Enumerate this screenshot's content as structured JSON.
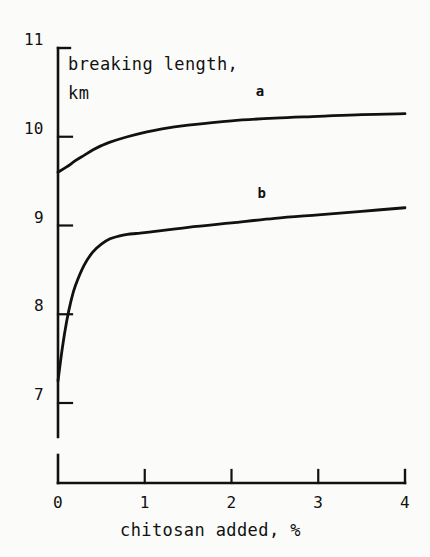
{
  "figure": {
    "background_color": "#fbfbfa",
    "ink_color": "#111111"
  },
  "chart_data": {
    "type": "line",
    "title": "",
    "xlabel": "chitosan added, %",
    "ylabel": "breaking length, km",
    "ylabel_line1": "breaking length,",
    "ylabel_line2": "km",
    "xlim": [
      0,
      4
    ],
    "ylim": [
      7,
      11
    ],
    "xticks": [
      0,
      1,
      2,
      3,
      4
    ],
    "yticks": [
      7,
      8,
      9,
      10,
      11
    ],
    "xtick_labels": [
      "0",
      "1",
      "2",
      "3",
      "4"
    ],
    "ytick_labels": [
      "7",
      "8",
      "9",
      "10",
      "11"
    ],
    "grid": false,
    "legend": "inline-curve-labels",
    "y_axis_break": true,
    "y_axis_break_note": "axis line is broken below the 7 tick before meeting the x-axis origin",
    "series": [
      {
        "name": "a",
        "label": "a",
        "label_x": 2.28,
        "label_y": 10.5,
        "x": [
          0,
          0.1,
          0.2,
          0.3,
          0.4,
          0.5,
          0.6,
          0.8,
          1.0,
          1.2,
          1.5,
          2.0,
          2.5,
          3.0,
          3.5,
          4.0
        ],
        "y": [
          9.6,
          9.66,
          9.73,
          9.79,
          9.85,
          9.9,
          9.94,
          10.0,
          10.05,
          10.09,
          10.13,
          10.18,
          10.21,
          10.23,
          10.25,
          10.26
        ]
      },
      {
        "name": "b",
        "label": "b",
        "label_x": 2.3,
        "label_y": 9.35,
        "x": [
          0,
          0.05,
          0.1,
          0.15,
          0.2,
          0.3,
          0.4,
          0.5,
          0.6,
          0.7,
          0.8,
          0.9,
          1.0,
          1.5,
          2.0,
          2.5,
          3.0,
          3.5,
          4.0
        ],
        "y": [
          7.25,
          7.62,
          7.92,
          8.15,
          8.32,
          8.55,
          8.7,
          8.79,
          8.85,
          8.88,
          8.9,
          8.91,
          8.92,
          8.98,
          9.03,
          9.08,
          9.12,
          9.16,
          9.2
        ]
      }
    ]
  }
}
